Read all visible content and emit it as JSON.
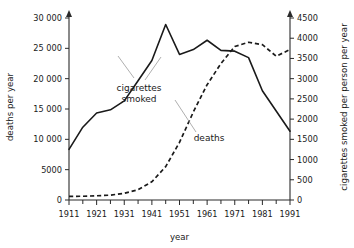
{
  "chart_data": {
    "type": "line",
    "title": "",
    "xlabel": "year",
    "ylabel": "deaths per year",
    "y2label": "cigarettes smoked per person per year",
    "grid": false,
    "legend": "annotations-inline",
    "xlim": [
      1911,
      1991
    ],
    "ylim": [
      0,
      30000
    ],
    "y2lim": [
      0,
      4500
    ],
    "xticks": [
      1911,
      1921,
      1931,
      1941,
      1951,
      1961,
      1971,
      1981,
      1991
    ],
    "xtick_labels": [
      "1911",
      "1921",
      "1931",
      "1941",
      "1951",
      "1961",
      "1971",
      "1981",
      "1991"
    ],
    "x_minor_ticks": [
      1916,
      1926,
      1936,
      1946,
      1956,
      1966,
      1976,
      1986
    ],
    "yticks": [
      0,
      5000,
      10000,
      15000,
      20000,
      25000,
      30000
    ],
    "ytick_labels": [
      "0",
      "5000",
      "10 000",
      "15 000",
      "20 000",
      "25 000",
      "30 000"
    ],
    "y2ticks": [
      0,
      500,
      1000,
      1500,
      2000,
      2500,
      3000,
      3500,
      4000,
      4500
    ],
    "y2tick_labels": [
      "0",
      "500",
      "1000",
      "1500",
      "2000",
      "2500",
      "3000",
      "3500",
      "4000",
      "4500"
    ],
    "series": [
      {
        "name": "cigarettes smoked",
        "axis": "right",
        "style": "solid",
        "units": "cigarettes smoked per person per year",
        "x": [
          1911,
          1916,
          1921,
          1926,
          1931,
          1936,
          1941,
          1946,
          1951,
          1956,
          1961,
          1966,
          1971,
          1976,
          1981,
          1986,
          1991
        ],
        "values": [
          1250,
          1800,
          2150,
          2230,
          2450,
          2950,
          3450,
          4340,
          3600,
          3720,
          3950,
          3700,
          3680,
          3520,
          2700,
          2200,
          1700
        ]
      },
      {
        "name": "deaths",
        "axis": "left",
        "style": "dashed",
        "units": "deaths per year",
        "x": [
          1911,
          1916,
          1921,
          1926,
          1931,
          1936,
          1941,
          1946,
          1951,
          1956,
          1961,
          1966,
          1971,
          1976,
          1981,
          1986,
          1991
        ],
        "values": [
          600,
          620,
          700,
          800,
          1100,
          1700,
          3000,
          5500,
          9500,
          14500,
          19000,
          22500,
          25300,
          26000,
          25600,
          23700,
          24800
        ]
      }
    ],
    "annotations": [
      {
        "text_line1": "cigarettes",
        "text_line2": "smoked",
        "points_to_series": "cigarettes smoked"
      },
      {
        "text_line1": "deaths",
        "text_line2": "",
        "points_to_series": "deaths"
      }
    ]
  },
  "axes": {
    "left_title": "deaths per year",
    "right_title": "cigarettes smoked per person per year",
    "bottom_title": "year"
  },
  "labels": {
    "cigarettes_l1": "cigarettes",
    "cigarettes_l2": "smoked",
    "deaths": "deaths"
  },
  "colors": {
    "ink": "#1a1a1a",
    "leader": "#9a9a9a",
    "background": "#ffffff"
  }
}
